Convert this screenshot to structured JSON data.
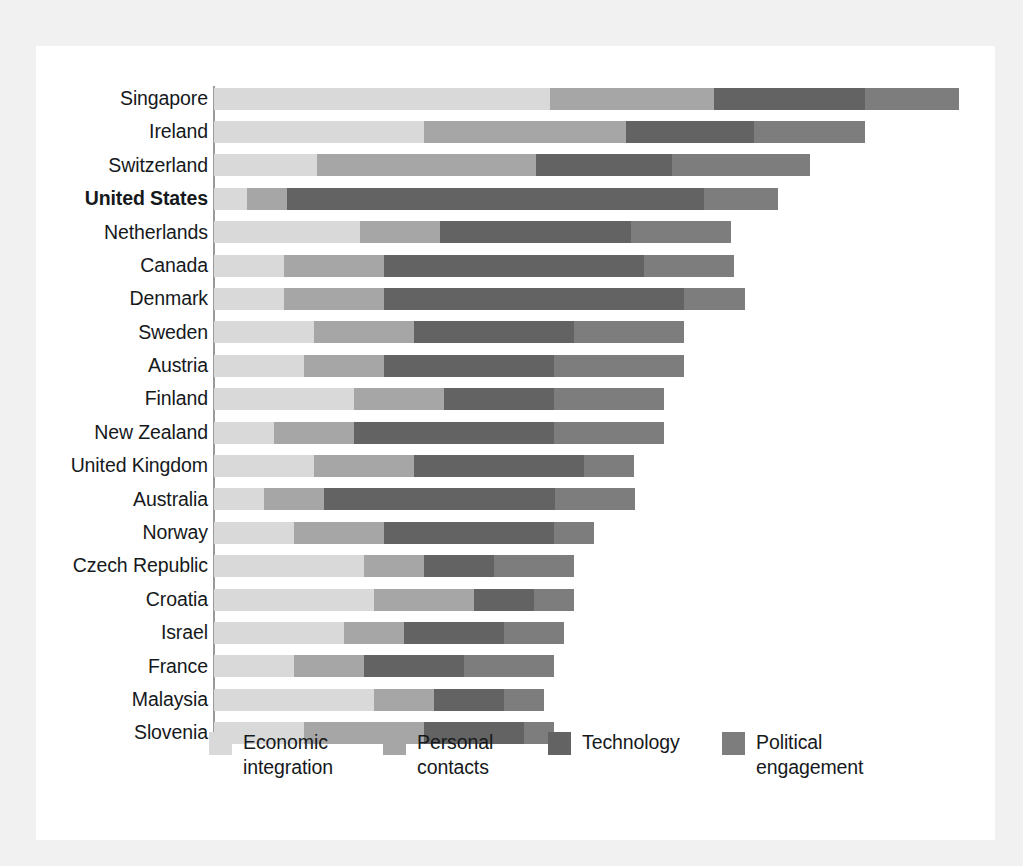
{
  "chart_data": {
    "type": "bar",
    "subtype": "stacked-horizontal-bar",
    "title": "",
    "subtitle": "",
    "xlabel": "",
    "ylabel": "",
    "grid": false,
    "legend_position": "bottom",
    "axis_max": 100,
    "series": [
      {
        "name": "Economic integration",
        "color": "#d9d9d9",
        "values": [
          43.6,
          27.3,
          13.4,
          4.3,
          19.0,
          9.1,
          9.1,
          13.0,
          11.7,
          18.2,
          7.8,
          13.0,
          6.5,
          10.4,
          19.5,
          20.8,
          16.9,
          10.4,
          20.8,
          11.7
        ]
      },
      {
        "name": "Personal contacts",
        "color": "#a6a6a6",
        "values": [
          21.4,
          26.2,
          28.4,
          5.2,
          10.4,
          13.0,
          13.0,
          13.0,
          10.4,
          11.7,
          10.4,
          13.0,
          7.8,
          11.7,
          7.8,
          13.0,
          7.8,
          9.1,
          7.8,
          15.6
        ]
      },
      {
        "name": "Technology",
        "color": "#636363",
        "values": [
          19.5,
          16.6,
          17.7,
          54.1,
          24.7,
          33.8,
          39.0,
          20.8,
          22.1,
          14.3,
          25.9,
          22.1,
          30.0,
          22.1,
          9.1,
          7.8,
          13.0,
          13.0,
          9.1,
          13.0
        ]
      },
      {
        "name": "Political engagement",
        "color": "#7d7d7d",
        "values": [
          12.3,
          14.5,
          17.9,
          9.7,
          13.0,
          11.7,
          7.8,
          14.3,
          16.9,
          14.3,
          14.3,
          6.5,
          10.4,
          5.2,
          10.4,
          5.2,
          7.8,
          11.7,
          5.2,
          3.9
        ]
      }
    ],
    "categories": [
      "Singapore",
      "Ireland",
      "Switzerland",
      "United States",
      "Netherlands",
      "Canada",
      "Denmark",
      "Sweden",
      "Austria",
      "Finland",
      "New Zealand",
      "United Kingdom",
      "Australia",
      "Norway",
      "Czech Republic",
      "Croatia",
      "Israel",
      "France",
      "Malaysia",
      "Slovenia"
    ],
    "highlighted_category": "United States"
  },
  "legend": {
    "items": [
      {
        "label": "Economic\nintegration",
        "color": "#d9d9d9"
      },
      {
        "label": "Personal\ncontacts",
        "color": "#a6a6a6"
      },
      {
        "label": "Technology",
        "color": "#636363"
      },
      {
        "label": "Political\nengagement",
        "color": "#7d7d7d"
      }
    ]
  },
  "colors": {
    "page_background": "#f1f1f1",
    "panel_background": "#ffffff",
    "text": "#16191c",
    "axis": "#9a9a9a"
  }
}
